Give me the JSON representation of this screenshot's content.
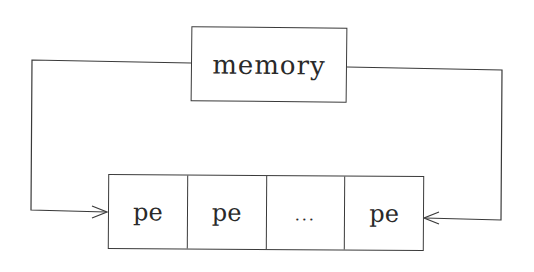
{
  "diagram": {
    "type": "block-diagram",
    "memory": {
      "label": "memory"
    },
    "processing_elements": [
      {
        "label": "pe"
      },
      {
        "label": "pe"
      },
      {
        "label": "..."
      },
      {
        "label": "pe"
      }
    ],
    "connections": [
      {
        "from": "memory",
        "to": "processing_elements.0",
        "side": "left",
        "arrow": "open"
      },
      {
        "from": "memory",
        "to": "processing_elements.3",
        "side": "right",
        "arrow": "open"
      }
    ],
    "colors": {
      "line": "#3a3a3a",
      "text": "#2a2a2a",
      "background": "#ffffff"
    }
  }
}
